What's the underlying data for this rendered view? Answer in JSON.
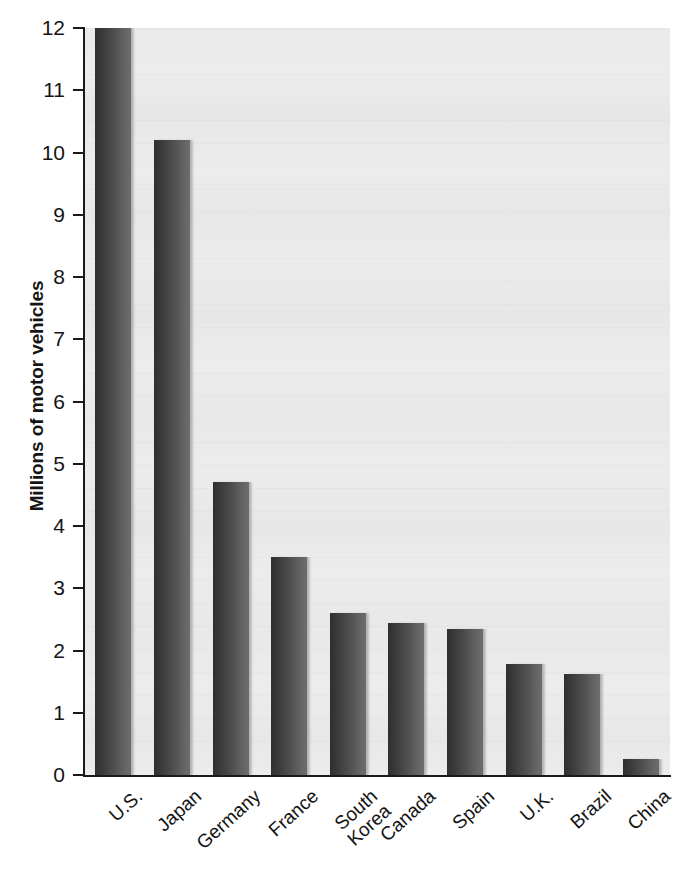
{
  "chart_data": {
    "type": "bar",
    "title": "",
    "subtitle": "",
    "xlabel": "",
    "ylabel": "Millions of motor vehicles",
    "categories": [
      "U.S.",
      "Japan",
      "Germany",
      "France",
      "South\nKorea",
      "Canada",
      "Spain",
      "U.K.",
      "Brazil",
      "China"
    ],
    "values": [
      12.0,
      10.2,
      4.7,
      3.5,
      2.6,
      2.45,
      2.35,
      1.78,
      1.63,
      0.25
    ],
    "ylim": [
      0,
      12
    ],
    "ytick_labels": [
      "12",
      "11",
      "10",
      "9",
      "8",
      "7",
      "6",
      "5",
      "4",
      "3",
      "2",
      "1",
      "0"
    ],
    "ytick_values": [
      12,
      11,
      10,
      9,
      8,
      7,
      6,
      5,
      4,
      3,
      2,
      1,
      0
    ],
    "grid": false,
    "legend": "none",
    "bar_color": "#4e4e4e",
    "plot_background": "#ececec",
    "axis_color": "#1a1a1a"
  }
}
